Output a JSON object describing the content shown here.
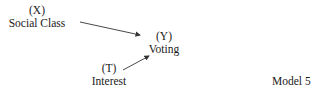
{
  "diagram": {
    "nodes": [
      {
        "id": "X",
        "var": "(X)",
        "label": "Social Class"
      },
      {
        "id": "Y",
        "var": "(Y)",
        "label": "Voting"
      },
      {
        "id": "T",
        "var": "(T)",
        "label": "Interest"
      }
    ],
    "edges": [
      {
        "from": "X",
        "to": "Y"
      },
      {
        "from": "T",
        "to": "Y"
      }
    ],
    "caption": "Model 5",
    "colors": {
      "text": "#1a1a1a",
      "arrow": "#333333",
      "background": "#ffffff"
    }
  }
}
